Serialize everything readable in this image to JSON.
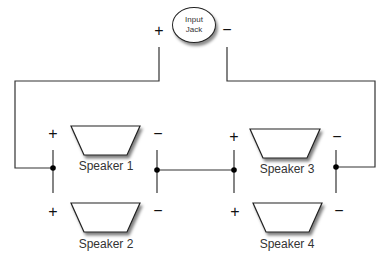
{
  "diagram": {
    "input_jack": {
      "line1": "Input",
      "line2": "Jack",
      "plus": "+",
      "minus": "−"
    },
    "speakers": [
      {
        "label": "Speaker 1",
        "plus": "+",
        "minus": "−"
      },
      {
        "label": "Speaker 2",
        "plus": "+",
        "minus": "−"
      },
      {
        "label": "Speaker 3",
        "plus": "+",
        "minus": "−"
      },
      {
        "label": "Speaker 4",
        "plus": "+",
        "minus": "−"
      }
    ],
    "colors": {
      "wire": "#333333",
      "background": "#ffffff"
    }
  }
}
